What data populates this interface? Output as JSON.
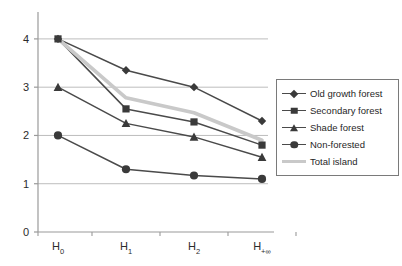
{
  "chart_data": {
    "type": "line",
    "title": "",
    "xlabel": "",
    "ylabel": "",
    "categories": [
      "H0",
      "H1",
      "H2",
      "H+oo"
    ],
    "tick_labels": [
      {
        "base": "H",
        "sub": "0"
      },
      {
        "base": "H",
        "sub": "1"
      },
      {
        "base": "H",
        "sub": "2"
      },
      {
        "base": "H",
        "sub": "+∞"
      }
    ],
    "ylim": [
      0,
      4.35
    ],
    "yticks": [
      0,
      1,
      2,
      3,
      4
    ],
    "ytick_labels": [
      "0",
      "1",
      "2",
      "3",
      "4"
    ],
    "grid": "horizontal",
    "gridlines_at": [
      1,
      2,
      3,
      4
    ],
    "legend_position": "right",
    "series": [
      {
        "name": "Old growth forest",
        "marker": "diamond",
        "color": "#4a4a4a",
        "values": [
          4.0,
          3.35,
          3.0,
          2.3
        ]
      },
      {
        "name": "Secondary forest",
        "marker": "square",
        "color": "#4a4a4a",
        "values": [
          4.0,
          2.55,
          2.28,
          1.8
        ]
      },
      {
        "name": "Shade forest",
        "marker": "triangle",
        "color": "#4a4a4a",
        "values": [
          3.0,
          2.25,
          1.97,
          1.55
        ]
      },
      {
        "name": "Non-forested",
        "marker": "circle",
        "color": "#4a4a4a",
        "values": [
          2.0,
          1.3,
          1.17,
          1.1
        ]
      },
      {
        "name": "Total island",
        "marker": "none",
        "color": "#c9c9c9",
        "values": [
          4.0,
          2.78,
          2.47,
          1.9
        ]
      }
    ]
  },
  "legend": {
    "items": [
      {
        "label": "Old growth forest"
      },
      {
        "label": "Secondary forest"
      },
      {
        "label": "Shade forest"
      },
      {
        "label": "Non-forested"
      },
      {
        "label": "Total island"
      }
    ]
  }
}
